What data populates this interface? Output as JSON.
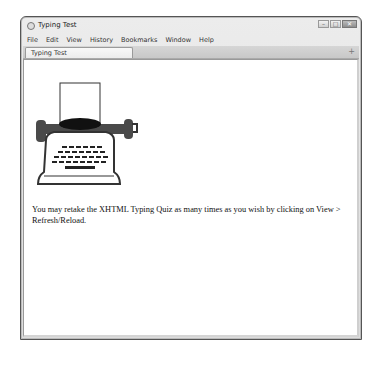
{
  "window": {
    "title": "Typing Test",
    "controls": {
      "minimize": "–",
      "maximize": "□",
      "close": "✕"
    }
  },
  "menubar": {
    "items": [
      "File",
      "Edit",
      "View",
      "History",
      "Bookmarks",
      "Window",
      "Help"
    ]
  },
  "tabs": {
    "items": [
      {
        "label": "Typing Test",
        "active": true
      }
    ],
    "new_tab_label": "+"
  },
  "page": {
    "image": {
      "icon": "typewriter-image"
    },
    "message": "You may retake the XHTML Typing Quiz as many times as you wish by clicking on View > Refresh/Reload."
  }
}
